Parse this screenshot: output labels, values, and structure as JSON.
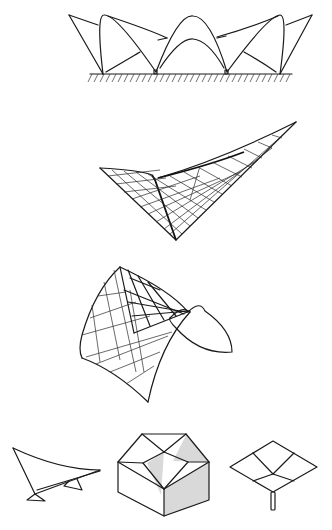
{
  "figure": {
    "description": "Hyperbolic paraboloid (hypar) shell structure studies",
    "panels": [
      {
        "id": "elevation-row",
        "label": "Row of saddle shells in elevation on ground line"
      },
      {
        "id": "hypar-saddle-wing",
        "label": "Hypar shell with ruled grid, single low support"
      },
      {
        "id": "hypar-saddle-dome",
        "label": "Saddle-shaped hypar with ruled line grid"
      },
      {
        "id": "sail-hypar",
        "label": "Single hypar sail on two supports"
      },
      {
        "id": "four-hypar-roof",
        "label": "Four hypar units forming roof over block"
      },
      {
        "id": "umbrella-hypar",
        "label": "Inverted umbrella of four hypars on central column"
      }
    ],
    "colors": {
      "line": "#1a1a1a",
      "shade": "#d9d9d9",
      "background": "#ffffff"
    }
  }
}
